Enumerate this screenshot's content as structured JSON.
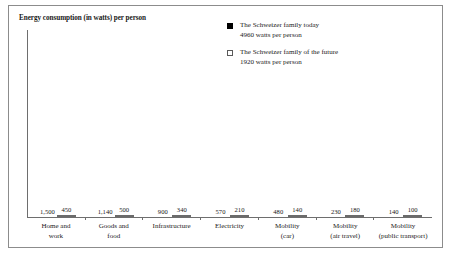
{
  "chart_data": {
    "type": "bar",
    "title": "Energy consumption (in watts) per person",
    "xlabel": "",
    "ylabel": "",
    "ylim": [
      0,
      1600
    ],
    "grid": false,
    "legend_position": "top-right",
    "categories": [
      "Home and work",
      "Goods and food",
      "Infrastructure",
      "Electricity",
      "Mobility (car)",
      "Mobility (air travel)",
      "Mobility (public transport)"
    ],
    "category_lines": [
      [
        "Home and",
        "work"
      ],
      [
        "Goods and",
        "food"
      ],
      [
        "Infrastructure",
        ""
      ],
      [
        "Electricity",
        ""
      ],
      [
        "Mobility",
        "(car)"
      ],
      [
        "Mobility",
        "(air travel)"
      ],
      [
        "Mobility",
        "(public transport)"
      ]
    ],
    "series": [
      {
        "name": "The Schweizer family today",
        "subtitle": "4960 watts per person",
        "color": "#000000",
        "values": [
          1500,
          1140,
          900,
          570,
          480,
          230,
          140
        ],
        "labels": [
          "1,500",
          "1,140",
          "900",
          "570",
          "480",
          "230",
          "140"
        ]
      },
      {
        "name": "The Schweizer family of the future",
        "subtitle": "1920 watts per person",
        "color": "#cbcbcb",
        "values": [
          450,
          500,
          340,
          210,
          140,
          180,
          100
        ],
        "labels": [
          "450",
          "500",
          "340",
          "210",
          "140",
          "180",
          "100"
        ]
      }
    ]
  },
  "legend": {
    "items": [
      {
        "name": "The Schweizer family today",
        "subtitle": "4960 watts per person",
        "swatch": "filled-black-square"
      },
      {
        "name": "The Schweizer family of the future",
        "subtitle": "1920 watts per person",
        "swatch": "outlined-white-square"
      }
    ]
  }
}
